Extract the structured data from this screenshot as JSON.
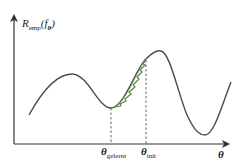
{
  "diagram": {
    "type": "loss-landscape",
    "y_axis": {
      "label_main": "R",
      "label_sub": "emp",
      "label_arg": "(f",
      "label_arg_sub": "θ",
      "label_close": ")"
    },
    "x_axis": {
      "label": "θ"
    },
    "ticks": [
      {
        "id": "learned",
        "symbol": "θ",
        "sub": "gelernt"
      },
      {
        "id": "init",
        "symbol": "θ",
        "sub": "init"
      }
    ],
    "colors": {
      "curve": "#4a4a4a",
      "axis": "#333333",
      "descent_path": "#4f8a3c",
      "dashed": "#555555"
    }
  }
}
